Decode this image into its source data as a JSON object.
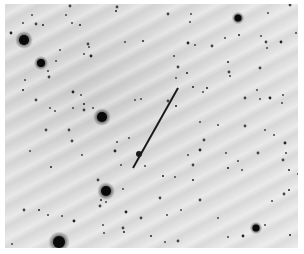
{
  "image": {
    "type": "inverted-star-field",
    "background_color": "#dedede",
    "border_color": "#ffffff",
    "frame": {
      "x": 5,
      "y": 4,
      "width": 293,
      "height": 244
    }
  },
  "streak": {
    "x1": 178,
    "y1": 88,
    "x2": 133,
    "y2": 168,
    "color": "#1a1a1a",
    "width": 2,
    "blob": {
      "x": 139,
      "y": 154,
      "r": 3
    }
  },
  "bright_stars": [
    {
      "x": 24,
      "y": 40,
      "r": 5
    },
    {
      "x": 41,
      "y": 63,
      "r": 4
    },
    {
      "x": 102,
      "y": 117,
      "r": 5
    },
    {
      "x": 106,
      "y": 191,
      "r": 5
    },
    {
      "x": 59,
      "y": 242,
      "r": 6
    },
    {
      "x": 238,
      "y": 18,
      "r": 3.5
    },
    {
      "x": 256,
      "y": 228,
      "r": 3.5
    }
  ],
  "faint_stars": [
    [
      11,
      33
    ],
    [
      23,
      23
    ],
    [
      32,
      15
    ],
    [
      36,
      24
    ],
    [
      43,
      25
    ],
    [
      66,
      15
    ],
    [
      70,
      6
    ],
    [
      72,
      23
    ],
    [
      80,
      25
    ],
    [
      88,
      44
    ],
    [
      89,
      47
    ],
    [
      84,
      54
    ],
    [
      91,
      56
    ],
    [
      60,
      50
    ],
    [
      56,
      61
    ],
    [
      117,
      7
    ],
    [
      116,
      11
    ],
    [
      48,
      71
    ],
    [
      49,
      77
    ],
    [
      25,
      80
    ],
    [
      23,
      90
    ],
    [
      36,
      100
    ],
    [
      50,
      108
    ],
    [
      55,
      111
    ],
    [
      73,
      92
    ],
    [
      81,
      95
    ],
    [
      73,
      108
    ],
    [
      84,
      110
    ],
    [
      84,
      104
    ],
    [
      93,
      108
    ],
    [
      69,
      130
    ],
    [
      125,
      42
    ],
    [
      143,
      41
    ],
    [
      168,
      14
    ],
    [
      190,
      22
    ],
    [
      191,
      14
    ],
    [
      188,
      43
    ],
    [
      195,
      45
    ],
    [
      174,
      56
    ],
    [
      178,
      67
    ],
    [
      187,
      73
    ],
    [
      176,
      78
    ],
    [
      212,
      46
    ],
    [
      225,
      38
    ],
    [
      239,
      35
    ],
    [
      266,
      42
    ],
    [
      267,
      48
    ],
    [
      261,
      36
    ],
    [
      281,
      42
    ],
    [
      296,
      33
    ],
    [
      268,
      13
    ],
    [
      290,
      5
    ],
    [
      193,
      87
    ],
    [
      203,
      92
    ],
    [
      229,
      72
    ],
    [
      230,
      76
    ],
    [
      228,
      62
    ],
    [
      245,
      98
    ],
    [
      257,
      90
    ],
    [
      260,
      99
    ],
    [
      270,
      98
    ],
    [
      283,
      95
    ],
    [
      282,
      103
    ],
    [
      260,
      68
    ],
    [
      207,
      88
    ],
    [
      200,
      122
    ],
    [
      204,
      140
    ],
    [
      218,
      125
    ],
    [
      228,
      168
    ],
    [
      245,
      126
    ],
    [
      265,
      130
    ],
    [
      274,
      135
    ],
    [
      285,
      143
    ],
    [
      286,
      153
    ],
    [
      305,
      113
    ],
    [
      283,
      160
    ],
    [
      289,
      170
    ],
    [
      302,
      183
    ],
    [
      46,
      130
    ],
    [
      30,
      151
    ],
    [
      51,
      167
    ],
    [
      72,
      141
    ],
    [
      82,
      155
    ],
    [
      117,
      142
    ],
    [
      115,
      151
    ],
    [
      129,
      138
    ],
    [
      121,
      165
    ],
    [
      98,
      180
    ],
    [
      101,
      200
    ],
    [
      106,
      202
    ],
    [
      100,
      206
    ],
    [
      123,
      189
    ],
    [
      39,
      210
    ],
    [
      24,
      210
    ],
    [
      48,
      215
    ],
    [
      62,
      216
    ],
    [
      74,
      221
    ],
    [
      103,
      225
    ],
    [
      104,
      233
    ],
    [
      123,
      228
    ],
    [
      124,
      232
    ],
    [
      145,
      166
    ],
    [
      160,
      198
    ],
    [
      175,
      177
    ],
    [
      193,
      180
    ],
    [
      200,
      200
    ],
    [
      218,
      218
    ],
    [
      228,
      237
    ],
    [
      243,
      236
    ],
    [
      265,
      225
    ],
    [
      272,
      201
    ],
    [
      284,
      194
    ],
    [
      289,
      190
    ],
    [
      298,
      174
    ],
    [
      258,
      153
    ],
    [
      226,
      153
    ],
    [
      163,
      176
    ],
    [
      193,
      165
    ],
    [
      188,
      155
    ],
    [
      12,
      244
    ],
    [
      126,
      212
    ],
    [
      167,
      215
    ],
    [
      181,
      210
    ],
    [
      141,
      218
    ],
    [
      151,
      236
    ],
    [
      165,
      242
    ],
    [
      178,
      241
    ],
    [
      245,
      250
    ],
    [
      290,
      235
    ],
    [
      300,
      228
    ],
    [
      238,
      161
    ],
    [
      242,
      170
    ],
    [
      200,
      150
    ],
    [
      135,
      100
    ],
    [
      141,
      99
    ],
    [
      168,
      101
    ],
    [
      176,
      106
    ]
  ]
}
